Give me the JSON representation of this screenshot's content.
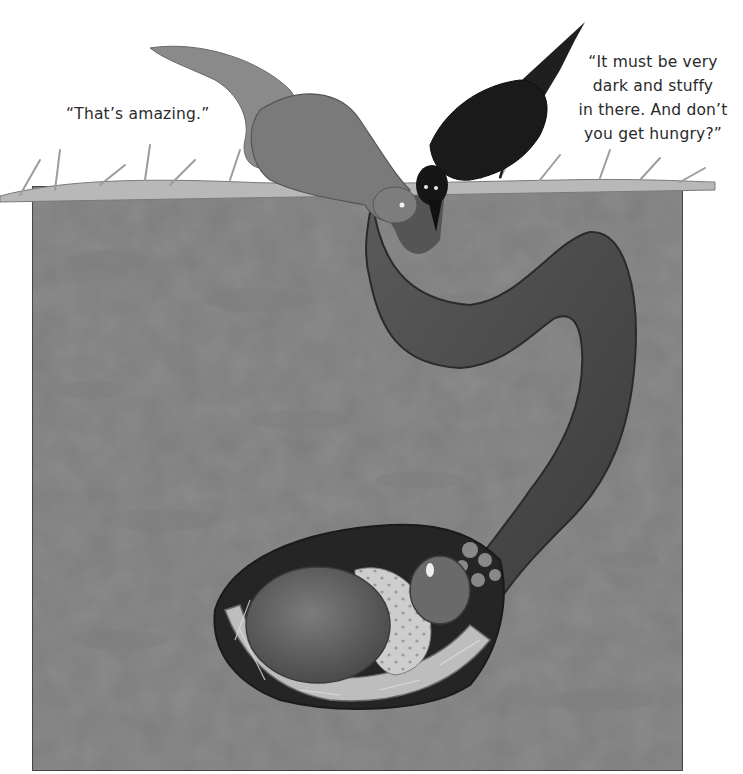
{
  "illustration": {
    "style": "grayscale storybook watercolor",
    "palette": {
      "paper": "#ffffff",
      "soil": "#8c8c8c",
      "soil_edge": "#555555",
      "tunnel": "#4e4e4e",
      "tunnel_dark": "#2f2f2f",
      "grass": "#b5b5b5",
      "squirrel": "#7a7a7a",
      "crow": "#1c1c1c",
      "sleeper_body": "#6b6b6b",
      "blanket": "#c9c9c9",
      "text": "#2a2a2a"
    },
    "characters": [
      {
        "name": "squirrel",
        "position": "top edge, peering down into tunnel"
      },
      {
        "name": "crow",
        "position": "top edge, beak pointed into tunnel"
      },
      {
        "name": "sleeping-animal",
        "position": "bottom burrow chamber, curled in straw nest with spotted blanket"
      }
    ]
  },
  "dialogue": {
    "left_quote": "“That’s amazing.”",
    "right_quote": "“It must be very\ndark and stuffy\nin there. And don’t\nyou get hungry?”"
  }
}
